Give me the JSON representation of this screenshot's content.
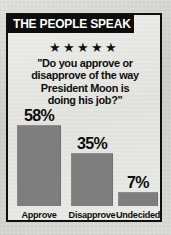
{
  "graphic": {
    "banner_title": "THE PEOPLE SPEAK",
    "stars": "★★★★★",
    "star_count": 5,
    "quote_lines": [
      "\"Do you approve or",
      "disapprove of the way",
      "President Moon is",
      "doing his job?\""
    ],
    "colors": {
      "banner_background": "#0d0d0d",
      "banner_text": "#ffffff",
      "bar_fill": "#7e7e7e",
      "border": "#101010",
      "panel_background": "#e8e8e5"
    }
  },
  "chart_data": {
    "type": "bar",
    "title": "THE PEOPLE SPEAK",
    "subtitle": "\"Do you approve or disapprove of the way President Moon is doing his job?\"",
    "categories": [
      "Approve",
      "Disapprove",
      "Undecided"
    ],
    "values": [
      58,
      35,
      7
    ],
    "value_labels": [
      "58%",
      "35%",
      "7%"
    ],
    "xlabel": "",
    "ylabel": "",
    "ylim": [
      0,
      65
    ],
    "grid": false,
    "legend": "none",
    "units": "percent"
  }
}
